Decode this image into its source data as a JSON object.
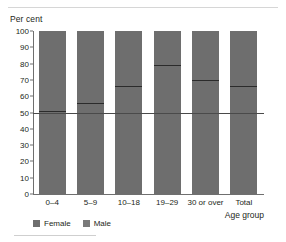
{
  "chart_data": {
    "type": "bar",
    "title": "",
    "subtitle": "",
    "ylabel": "Per cent",
    "xlabel": "Age group",
    "categories": [
      "0–4",
      "5–9",
      "10–18",
      "19–29",
      "30 or over",
      "Total"
    ],
    "series": [
      {
        "name": "Female",
        "values": [
          51,
          56,
          66,
          79,
          70,
          66
        ]
      },
      {
        "name": "Male",
        "values": [
          49,
          44,
          34,
          21,
          30,
          34
        ]
      }
    ],
    "stacked": true,
    "ylim": [
      0,
      100
    ],
    "yticks": [
      100,
      90,
      80,
      70,
      60,
      50,
      40,
      30,
      20,
      10,
      0
    ],
    "ytick_labels": [
      "100",
      "90",
      "80",
      "70",
      "60",
      "50",
      "40",
      "30",
      "20",
      "10",
      "0"
    ],
    "grid": false,
    "reference_line": {
      "value": 50,
      "label": ""
    },
    "legend": {
      "position": "bottom-left",
      "entries": [
        {
          "label": "Female",
          "color": "#6e6e6e"
        },
        {
          "label": "Male",
          "color": "#7a7a7a"
        }
      ]
    },
    "bar_color": "#6e6e6e",
    "divider_color": "#2b2b2b",
    "axis_color": "#6f6f6f"
  }
}
